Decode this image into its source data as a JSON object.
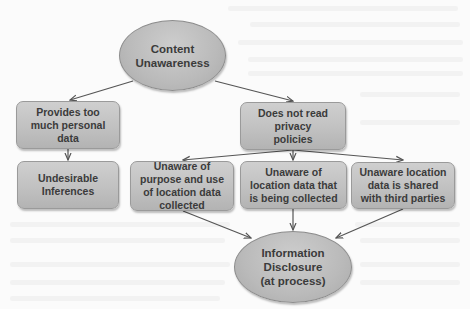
{
  "diagram": {
    "type": "flowchart",
    "colors": {
      "node_fill": "#c1c1c1",
      "node_border": "#9a9a9a",
      "ellipse_fill": "#bababa",
      "text": "#3b3b3b",
      "edge": "#555555",
      "background": "#fbfbfb"
    },
    "nodes": {
      "content_unawareness": {
        "shape": "ellipse",
        "label": "Content Unawareness"
      },
      "provides_too_much": {
        "shape": "rounded-rect",
        "label": "Provides too much personal data"
      },
      "does_not_read": {
        "shape": "rounded-rect",
        "label": "Does not read privacy policies"
      },
      "undesirable_inferences": {
        "shape": "rounded-rect",
        "label": "Undesirable Inferences"
      },
      "unaware_purpose": {
        "shape": "rounded-rect",
        "label": "Unaware of purpose and use of location data collected"
      },
      "unaware_collected": {
        "shape": "rounded-rect",
        "label": "Unaware of location data that is being collected"
      },
      "unaware_shared": {
        "shape": "rounded-rect",
        "label": "Unaware location data is shared with third parties"
      },
      "information_disclosure": {
        "shape": "ellipse",
        "label": "Information Disclosure (at process)"
      }
    },
    "edges": [
      {
        "from": "content_unawareness",
        "to": "provides_too_much"
      },
      {
        "from": "content_unawareness",
        "to": "does_not_read"
      },
      {
        "from": "provides_too_much",
        "to": "undesirable_inferences"
      },
      {
        "from": "does_not_read",
        "to": "unaware_purpose"
      },
      {
        "from": "does_not_read",
        "to": "unaware_collected"
      },
      {
        "from": "does_not_read",
        "to": "unaware_shared"
      },
      {
        "from": "unaware_purpose",
        "to": "information_disclosure"
      },
      {
        "from": "unaware_collected",
        "to": "information_disclosure"
      },
      {
        "from": "unaware_shared",
        "to": "information_disclosure"
      }
    ]
  }
}
